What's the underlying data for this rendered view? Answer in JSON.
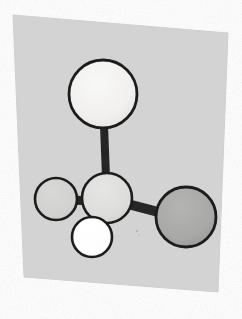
{
  "figure": {
    "kind": "ball-and-stick-molecular-model",
    "title": "Ball-and-stick molecular model",
    "page_background": "#ffffff",
    "scan_noise": true
  },
  "panel": {
    "name": "scanned-paper-panel",
    "fill": "#d3d3d3",
    "edge_fill": "#cfcfcf",
    "points": "13,15 228,33 218,292 24,277",
    "rotation_note": "slightly rotated clockwise, scanned page"
  },
  "style": {
    "outline_color": "#1c1c1c",
    "outline_width": 2.6,
    "bond_color": "#262626",
    "bond_shadow": "#3a3a3a"
  },
  "atoms": [
    {
      "id": "atom-top",
      "label": "top sphere",
      "cx": 103,
      "cy": 94,
      "r": 34,
      "fill": "#f3f2f0",
      "shade": "#e6e5e2",
      "outline": "#1c1c1c",
      "outline_width": 2.8,
      "size_class": "large"
    },
    {
      "id": "atom-center",
      "label": "central hub sphere",
      "cx": 107,
      "cy": 198,
      "r": 25,
      "fill": "#dededc",
      "shade": "#d0d0ce",
      "outline": "#1c1c1c",
      "outline_width": 2.6,
      "size_class": "medium"
    },
    {
      "id": "atom-left",
      "label": "left small sphere",
      "cx": 56,
      "cy": 199,
      "r": 21,
      "fill": "#d2d2d0",
      "shade": "#c9c9c7",
      "outline": "#1c1c1c",
      "outline_width": 2.6,
      "size_class": "small"
    },
    {
      "id": "atom-bottom",
      "label": "bottom white sphere",
      "cx": 92,
      "cy": 237,
      "r": 20,
      "fill": "#ffffff",
      "shade": "#f7f7f7",
      "outline": "#1c1c1c",
      "outline_width": 2.6,
      "size_class": "small"
    },
    {
      "id": "atom-right",
      "label": "right large gray sphere",
      "cx": 186,
      "cy": 217,
      "r": 30,
      "fill": "#a9a9a7",
      "shade": "#9b9b99",
      "outline": "#1c1c1c",
      "outline_width": 2.8,
      "size_class": "large"
    }
  ],
  "bonds": [
    {
      "id": "bond-top-center",
      "label": "vertical bond between top sphere and hub",
      "x1": 104,
      "y1": 125,
      "x2": 106,
      "y2": 177,
      "width": 8,
      "color": "#262626"
    },
    {
      "id": "bond-left-center",
      "label": "horizontal bond between left sphere and hub",
      "x1": 73,
      "y1": 200,
      "x2": 90,
      "y2": 201,
      "width": 9,
      "color": "#262626"
    },
    {
      "id": "bond-center-right",
      "label": "angled bond between hub and right sphere",
      "x1": 124,
      "y1": 203,
      "x2": 162,
      "y2": 213,
      "width": 10,
      "color": "#262626"
    },
    {
      "id": "bond-center-bottom",
      "label": "short bond stub between hub and bottom white sphere",
      "x1": 99,
      "y1": 215,
      "x2": 96,
      "y2": 223,
      "width": 8,
      "color": "#262626"
    }
  ]
}
